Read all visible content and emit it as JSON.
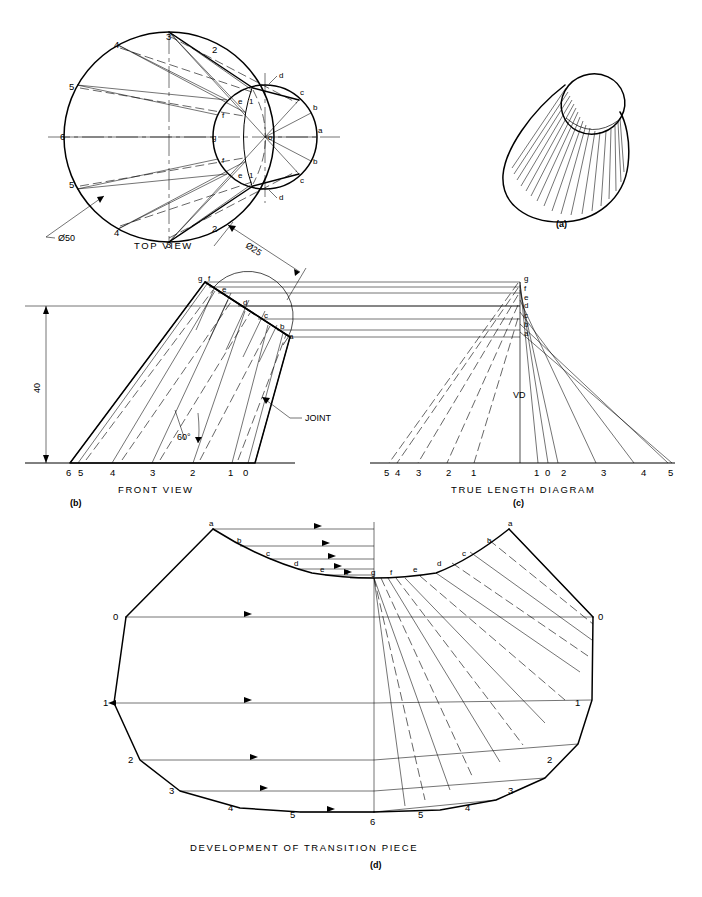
{
  "document": {
    "type": "engineering-drawing",
    "subject": "Development of a transition piece (oblique cone joining a large circle to a small circle)",
    "footer_caption": ""
  },
  "figures": {
    "a": {
      "key": "(a)",
      "caption": "",
      "description": "pictorial view of transition piece"
    },
    "b": {
      "key": "(b)",
      "caption": "FRONT VIEW",
      "joint_label": "JOINT",
      "angle_label": "60°",
      "height_dimension": "40",
      "top_diameter_dimension": "Ø25",
      "base_numbers": [
        "6",
        "5",
        "4",
        "3",
        "2",
        "1",
        "0"
      ],
      "top_letters": [
        "g",
        "f",
        "e",
        "d",
        "c",
        "b",
        "a"
      ]
    },
    "c": {
      "key": "(c)",
      "caption": "TRUE LENGTH DIAGRAM",
      "vertical_distance_label": "VD",
      "left_numbers": [
        "5",
        "4",
        "3",
        "2",
        "1"
      ],
      "right_numbers": [
        "1",
        "0",
        "2",
        "3",
        "4",
        "5"
      ],
      "apex_letters": [
        "g",
        "f",
        "e",
        "d",
        "c",
        "b",
        "a"
      ]
    },
    "d": {
      "key": "(d)",
      "caption": "DEVELOPMENT OF TRANSITION PIECE",
      "left_numbers": [
        "0",
        "1",
        "2",
        "3",
        "4",
        "5",
        "6"
      ],
      "right_numbers": [
        "0",
        "1",
        "2",
        "3",
        "4",
        "5"
      ],
      "bottom_center_number": "6",
      "arc_letters_left": [
        "a",
        "b",
        "c",
        "d",
        "e",
        "f"
      ],
      "arc_letters_center": [
        "g"
      ],
      "arc_letters_right": [
        "f",
        "e",
        "d",
        "c",
        "b",
        "a"
      ]
    },
    "top_view": {
      "caption": "TOP VIEW",
      "big_diameter_dimension": "Ø50",
      "big_circle_numbers_upper": [
        "3",
        "4",
        "5",
        "2"
      ],
      "big_circle_numbers_left": [
        "6"
      ],
      "big_circle_numbers_lower": [
        "5",
        "4",
        "3",
        "2"
      ],
      "small_circle_letters_right": [
        "a",
        "b",
        "c",
        "d"
      ],
      "small_circle_letters_left": [
        "e",
        "f",
        "g"
      ],
      "small_circle_center": "o",
      "small_circle_ones": [
        "1",
        "1"
      ]
    }
  },
  "colors": {
    "line": "#000000",
    "paper": "#ffffff",
    "footer_text": "#b9b9b9"
  }
}
